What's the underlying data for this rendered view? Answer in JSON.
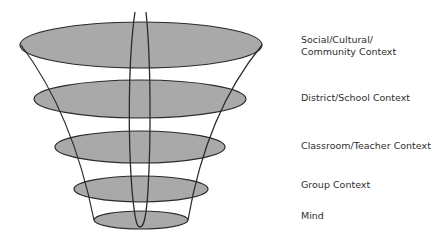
{
  "diagram": {
    "colors": {
      "fill": "#a9a9a9",
      "stroke": "#2b2b2b",
      "text": "#2e2e2e",
      "background": "#ffffff"
    },
    "layers": [
      {
        "id": "social",
        "label_line1": "Social/Cultural/",
        "label_line2": "Community Context",
        "cx": 141,
        "cy": 45,
        "rx": 121,
        "ry": 23
      },
      {
        "id": "district",
        "label_line1": "District/School Context",
        "label_line2": "",
        "cx": 140,
        "cy": 99,
        "rx": 106,
        "ry": 19
      },
      {
        "id": "classroom",
        "label_line1": "Classroom/Teacher Context",
        "label_line2": "",
        "cx": 140,
        "cy": 147,
        "rx": 85,
        "ry": 16
      },
      {
        "id": "group",
        "label_line1": "Group Context",
        "label_line2": "",
        "cx": 141,
        "cy": 189,
        "rx": 67,
        "ry": 13
      },
      {
        "id": "mind",
        "label_line1": "Mind",
        "label_line2": "",
        "cx": 141,
        "cy": 220,
        "rx": 47,
        "ry": 9
      }
    ]
  }
}
